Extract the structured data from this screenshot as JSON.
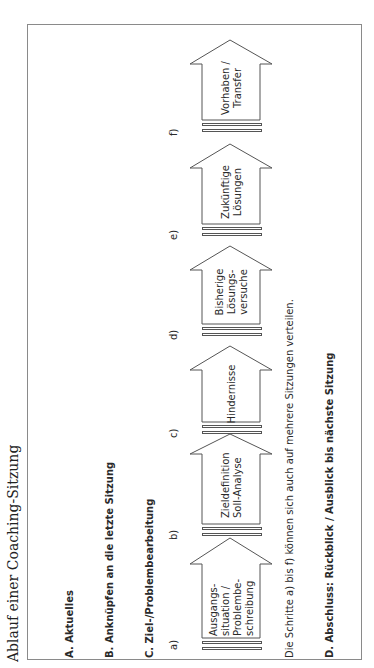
{
  "title": "Ablauf einer Coaching-Sitzung",
  "sections": {
    "a": "A. Aktuelles",
    "b": "B. Anknüpfen an die letzte Sitzung",
    "c": "C. Ziel-/Problembearbeitung",
    "d": "D. Abschluss: Rückblick / Ausblick bis nächste Sitzung"
  },
  "note": "Die Schritte a) bis f) können sich auch auf mehrere Sitzungen verteilen.",
  "steps": [
    {
      "label": "a)",
      "lines": [
        "Ausgangs-",
        "situation /",
        "Problembe-",
        "schreibung"
      ]
    },
    {
      "label": "b)",
      "lines": [
        "Zieldefinition",
        "Soll-Analyse"
      ]
    },
    {
      "label": "c)",
      "lines": [
        "Hindernisse"
      ]
    },
    {
      "label": "d)",
      "lines": [
        "Bisherige",
        "Lösungs-",
        "versuche"
      ]
    },
    {
      "label": "e)",
      "lines": [
        "Zukünftige",
        "Lösungen"
      ]
    },
    {
      "label": "f)",
      "lines": [
        "Vorhaben /",
        "Transfer"
      ]
    }
  ]
}
